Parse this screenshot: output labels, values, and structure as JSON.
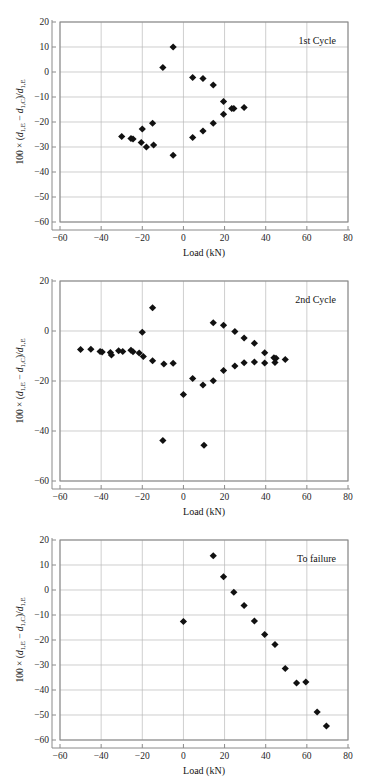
{
  "figure": {
    "background": "#ffffff",
    "marker_color": "#111111",
    "grid_color": "#b9b9b9",
    "axis_color": "#8a8a8a",
    "panel_count": 3
  },
  "axis_label_parts": {
    "prefix": "100 × (",
    "d": "d",
    "sub_e": "1,E",
    "minus": " − ",
    "sub_c": "1,C",
    "mid": ")/",
    "sub_e2": "1,E"
  },
  "chart_data": [
    {
      "id": "panel-1st-cycle",
      "type": "scatter",
      "title": "1st Cycle",
      "xlabel": "Load (kN)",
      "ylabel": "100 × (d1,E − d1,C)/d1,E",
      "xlim": [
        -60,
        80
      ],
      "ylim": [
        -60,
        20
      ],
      "xticks": [
        -60,
        -40,
        -20,
        0,
        20,
        40,
        60,
        80
      ],
      "yticks": [
        20,
        10,
        0,
        -10,
        -20,
        -30,
        -40,
        -50,
        -60
      ],
      "xticklabels": [
        "−60",
        "−40",
        "−20",
        "0",
        "20",
        "40",
        "60",
        "80"
      ],
      "yticklabels": [
        "20",
        "10",
        "0",
        "−10",
        "−20",
        "−30",
        "−40",
        "−50",
        "−60"
      ],
      "grid": true,
      "legend_position": "top-right-inside",
      "marker": "diamond",
      "points": [
        {
          "x": -30.0,
          "y": -25.8
        },
        {
          "x": -25.5,
          "y": -26.6
        },
        {
          "x": -24.5,
          "y": -26.8
        },
        {
          "x": -20.5,
          "y": -28.2
        },
        {
          "x": -20.0,
          "y": -22.8
        },
        {
          "x": -18.0,
          "y": -30.0
        },
        {
          "x": -15.0,
          "y": -20.5
        },
        {
          "x": -14.5,
          "y": -29.2
        },
        {
          "x": -10.0,
          "y": 1.8
        },
        {
          "x": -5.0,
          "y": 10.0
        },
        {
          "x": -5.0,
          "y": -33.3
        },
        {
          "x": 4.5,
          "y": -2.2
        },
        {
          "x": 4.5,
          "y": -26.2
        },
        {
          "x": 9.5,
          "y": -2.6
        },
        {
          "x": 9.5,
          "y": -23.6
        },
        {
          "x": 14.5,
          "y": -5.2
        },
        {
          "x": 14.5,
          "y": -20.5
        },
        {
          "x": 19.5,
          "y": -11.8
        },
        {
          "x": 19.5,
          "y": -16.9
        },
        {
          "x": 23.5,
          "y": -14.6
        },
        {
          "x": 24.5,
          "y": -14.6
        },
        {
          "x": 29.5,
          "y": -14.2
        }
      ]
    },
    {
      "id": "panel-2nd-cycle",
      "type": "scatter",
      "title": "2nd Cycle",
      "xlabel": "Load (kN)",
      "ylabel": "100 × (d1,E − d1,C)/d1,E",
      "xlim": [
        -60,
        80
      ],
      "ylim": [
        -60,
        20
      ],
      "xticks": [
        -60,
        -40,
        -20,
        0,
        20,
        40,
        60,
        80
      ],
      "yticks": [
        20,
        0,
        -20,
        -40,
        -60
      ],
      "xticklabels": [
        "−60",
        "−40",
        "−20",
        "0",
        "20",
        "40",
        "60",
        "80"
      ],
      "yticklabels": [
        "20",
        "0",
        "−20",
        "−40",
        "−60"
      ],
      "grid": true,
      "legend_position": "top-right-inside",
      "marker": "diamond",
      "points": [
        {
          "x": -50.0,
          "y": -7.4
        },
        {
          "x": -45.0,
          "y": -7.3
        },
        {
          "x": -40.5,
          "y": -8.2
        },
        {
          "x": -39.5,
          "y": -8.4
        },
        {
          "x": -35.5,
          "y": -8.6
        },
        {
          "x": -35.0,
          "y": -9.6
        },
        {
          "x": -31.5,
          "y": -7.9
        },
        {
          "x": -29.5,
          "y": -8.2
        },
        {
          "x": -25.5,
          "y": -7.7
        },
        {
          "x": -24.5,
          "y": -8.3
        },
        {
          "x": -21.5,
          "y": -8.8
        },
        {
          "x": -20.0,
          "y": -0.5
        },
        {
          "x": -19.5,
          "y": -10.2
        },
        {
          "x": -15.0,
          "y": 9.3
        },
        {
          "x": -15.0,
          "y": -11.9
        },
        {
          "x": -10.0,
          "y": -43.8
        },
        {
          "x": -9.5,
          "y": -13.2
        },
        {
          "x": -5.0,
          "y": -12.9
        },
        {
          "x": 0.0,
          "y": -25.4
        },
        {
          "x": 4.5,
          "y": -19.0
        },
        {
          "x": 9.5,
          "y": -21.6
        },
        {
          "x": 10.0,
          "y": -45.7
        },
        {
          "x": 14.5,
          "y": 3.3
        },
        {
          "x": 14.5,
          "y": -19.9
        },
        {
          "x": 19.5,
          "y": 2.3
        },
        {
          "x": 19.5,
          "y": -15.8
        },
        {
          "x": 25.0,
          "y": -0.2
        },
        {
          "x": 25.0,
          "y": -14.0
        },
        {
          "x": 29.5,
          "y": -2.8
        },
        {
          "x": 29.5,
          "y": -12.7
        },
        {
          "x": 34.5,
          "y": -4.9
        },
        {
          "x": 34.5,
          "y": -12.4
        },
        {
          "x": 39.5,
          "y": -8.7
        },
        {
          "x": 39.5,
          "y": -12.8
        },
        {
          "x": 44.0,
          "y": -10.7
        },
        {
          "x": 44.5,
          "y": -12.6
        },
        {
          "x": 45.0,
          "y": -10.9
        },
        {
          "x": 49.5,
          "y": -11.4
        }
      ]
    },
    {
      "id": "panel-to-failure",
      "type": "scatter",
      "title": "To failure",
      "xlabel": "Load (kN)",
      "ylabel": "100 × (d1,E − d1,C)/d1,E",
      "xlim": [
        -60,
        80
      ],
      "ylim": [
        -60,
        20
      ],
      "xticks": [
        -60,
        -40,
        -20,
        0,
        20,
        40,
        60,
        80
      ],
      "yticks": [
        20,
        10,
        0,
        -10,
        -20,
        -30,
        -40,
        -50,
        -60
      ],
      "xticklabels": [
        "−60",
        "−40",
        "−20",
        "0",
        "20",
        "40",
        "60",
        "80"
      ],
      "yticklabels": [
        "20",
        "10",
        "0",
        "−10",
        "−20",
        "−30",
        "−40",
        "−50",
        "−60"
      ],
      "grid": true,
      "legend_position": "top-right-inside",
      "marker": "diamond",
      "points": [
        {
          "x": 0.0,
          "y": -12.6
        },
        {
          "x": 14.5,
          "y": 13.7
        },
        {
          "x": 19.5,
          "y": 5.3
        },
        {
          "x": 24.5,
          "y": -0.9
        },
        {
          "x": 29.5,
          "y": -6.2
        },
        {
          "x": 34.5,
          "y": -12.4
        },
        {
          "x": 39.5,
          "y": -17.8
        },
        {
          "x": 44.5,
          "y": -21.8
        },
        {
          "x": 49.5,
          "y": -31.4
        },
        {
          "x": 55.0,
          "y": -37.2
        },
        {
          "x": 59.5,
          "y": -36.8
        },
        {
          "x": 65.0,
          "y": -48.8
        },
        {
          "x": 69.5,
          "y": -54.4
        }
      ]
    }
  ]
}
